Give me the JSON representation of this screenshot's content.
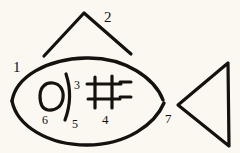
{
  "figure": {
    "background_color": "#faf8f1",
    "ink_color": "#14110f",
    "width": 240,
    "height": 153,
    "labels": [
      {
        "id": "1",
        "text": "1",
        "refers_to": "fish-body-upper-left-outline"
      },
      {
        "id": "2",
        "text": "2",
        "refers_to": "dorsal-fin-chevron"
      },
      {
        "id": "3",
        "text": "3",
        "refers_to": "left-vertical-bar-of-grid"
      },
      {
        "id": "4",
        "text": "4",
        "refers_to": "grid-crossbars"
      },
      {
        "id": "5",
        "text": "5",
        "refers_to": "curved-vertical-stroke"
      },
      {
        "id": "6",
        "text": "6",
        "refers_to": "eye-circle"
      },
      {
        "id": "7",
        "text": "7",
        "refers_to": "tail-triangle"
      }
    ],
    "strokes": [
      {
        "name": "fish-body-upper-arc",
        "kind": "arc"
      },
      {
        "name": "fish-body-lower-arc",
        "kind": "arc"
      },
      {
        "name": "dorsal-fin-chevron",
        "kind": "chevron"
      },
      {
        "name": "eye-circle",
        "kind": "circle"
      },
      {
        "name": "curved-vertical-stroke",
        "kind": "curve"
      },
      {
        "name": "grid-mark",
        "kind": "grid"
      },
      {
        "name": "tail-triangle",
        "kind": "triangle"
      }
    ]
  }
}
